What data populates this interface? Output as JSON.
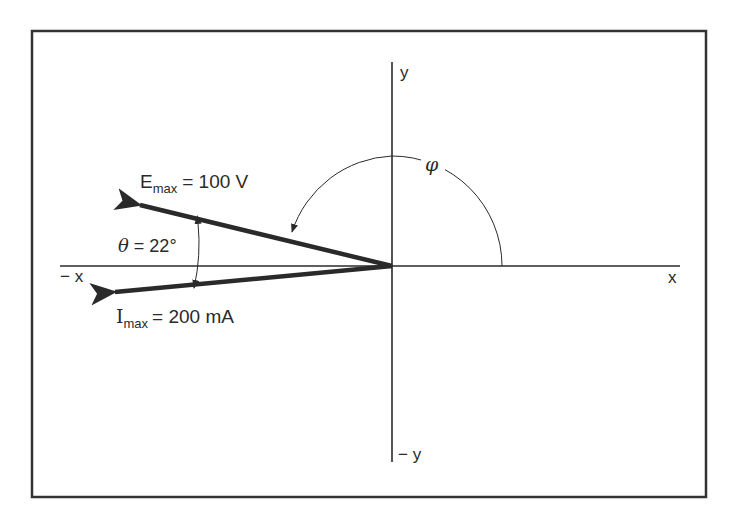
{
  "diagram": {
    "type": "phasor-diagram",
    "axes": {
      "x_positive": "x",
      "x_negative": "− x",
      "y_positive": "y",
      "y_negative": "− y"
    },
    "phasors": [
      {
        "name": "E",
        "symbol": "E",
        "subscript": "max",
        "label_value": "= 100 V",
        "magnitude": 100,
        "unit": "V",
        "angle_deg": 158
      },
      {
        "name": "I",
        "symbol": "I",
        "subscript": "max",
        "label_value": "= 200 mA",
        "magnitude": 200,
        "unit": "mA",
        "angle_deg": 180
      }
    ],
    "angles": {
      "theta": {
        "symbol": "θ",
        "label": "= 22°",
        "value_deg": 22
      },
      "phi": {
        "symbol": "φ"
      }
    },
    "colors": {
      "ink": "#2a2a2a",
      "frame": "#333333",
      "background": "#ffffff"
    }
  }
}
